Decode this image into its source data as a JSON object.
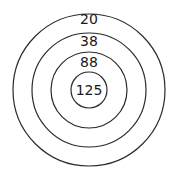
{
  "diagram": {
    "type": "concentric-circles",
    "center": {
      "x": 89,
      "y": 90
    },
    "stroke_color": "#2a2a2a",
    "rings": [
      {
        "radius": 76,
        "label": "20",
        "label_y": 24
      },
      {
        "radius": 57,
        "label": "38",
        "label_y": 46
      },
      {
        "radius": 38,
        "label": "88",
        "label_y": 67
      },
      {
        "radius": 18,
        "label": "125",
        "label_y": 95
      }
    ]
  }
}
